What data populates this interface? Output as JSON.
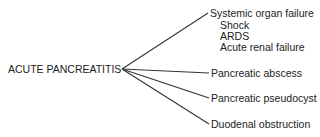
{
  "root": {
    "label": "ACUTE PANCREATITIS"
  },
  "branches": [
    {
      "label": "Systemic organ failure",
      "children": [
        "Shock",
        "ARDS",
        "Acute renal failure"
      ]
    },
    {
      "label": "Pancreatic abscess",
      "children": []
    },
    {
      "label": "Pancreatic pseudocyst",
      "children": []
    },
    {
      "label": "Duodenal obstruction",
      "children": []
    }
  ],
  "colors": {
    "line": "#333333",
    "text": "#222222",
    "background": "#ffffff"
  }
}
